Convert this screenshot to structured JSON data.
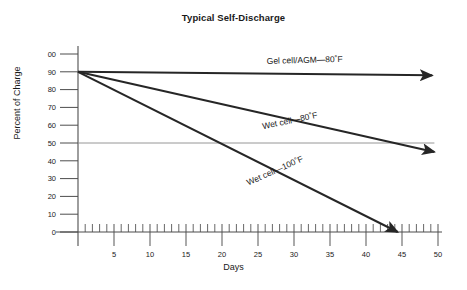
{
  "chart_data": {
    "type": "line",
    "title": "Typical Self-Discharge",
    "xlabel": "Days",
    "ylabel": "Percent of Charge",
    "xlim": [
      0,
      50
    ],
    "ylim": [
      0,
      100
    ],
    "grid": false,
    "legend_position": "inline-annotations",
    "x_ticks_major": [
      5,
      10,
      15,
      20,
      25,
      30,
      35,
      40,
      45,
      50
    ],
    "x_tick_labels": [
      "5",
      "10",
      "15",
      "20",
      "25",
      "30",
      "35",
      "40",
      "45",
      "50"
    ],
    "x_minor_tick_interval": 1,
    "y_ticks": [
      0,
      10,
      20,
      30,
      40,
      50,
      60,
      70,
      80,
      90,
      100
    ],
    "y_tick_labels": [
      "0",
      "10",
      "20",
      "30",
      "40",
      "50",
      "60",
      "70",
      "80",
      "90",
      "00"
    ],
    "reference_line": {
      "name": "fifty-percent-reference-line",
      "y": 50,
      "x_start": 0,
      "x_end": 49.5,
      "color": "#8a8a8a"
    },
    "series": [
      {
        "name": "Gel cell/AGM—80˚F",
        "label": "Gel cell/AGM—80˚F",
        "color": "#262626",
        "arrow": true,
        "points": [
          {
            "x": 0,
            "y": 90
          },
          {
            "x": 49.2,
            "y": 88
          }
        ],
        "label_x": 31.5,
        "label_y": 95,
        "label_rotation": -1.5
      },
      {
        "name": "Wet cell—80˚F",
        "label": "Wet cell—80˚F",
        "color": "#262626",
        "arrow": true,
        "points": [
          {
            "x": 0,
            "y": 90
          },
          {
            "x": 49.5,
            "y": 45
          }
        ],
        "label_x": 29.5,
        "label_y": 61,
        "label_rotation": -12
      },
      {
        "name": "Wet cell—100˚F",
        "label": "Wet cell—100˚F",
        "color": "#262626",
        "arrow": true,
        "points": [
          {
            "x": 0,
            "y": 90
          },
          {
            "x": 44.4,
            "y": 0
          }
        ],
        "label_x": 27.5,
        "label_y": 33,
        "label_rotation": -24
      }
    ],
    "axis_color": "#4d4d4d",
    "text_color": "#1a1a1a"
  }
}
